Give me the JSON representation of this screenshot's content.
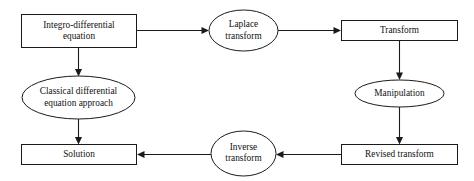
{
  "diagram": {
    "background_color": "#ffffff",
    "stroke_color": "#1a1a1a",
    "text_color": "#111111",
    "nodes": [
      {
        "id": "integro-differential-equation",
        "label": "Integro-differential\nequation",
        "shape": "rectangle",
        "x": 21,
        "y": 14,
        "w": 116,
        "h": 34
      },
      {
        "id": "laplace-transform",
        "label": "Laplace\ntransform",
        "shape": "ellipse",
        "x": 209,
        "y": 10,
        "w": 69,
        "h": 41
      },
      {
        "id": "transform",
        "label": "Transform",
        "shape": "rectangle",
        "x": 341,
        "y": 20,
        "w": 117,
        "h": 21
      },
      {
        "id": "classical-differential-equation-approach",
        "label": "Classical differential\nequation approach",
        "shape": "ellipse",
        "x": 22,
        "y": 76,
        "w": 113,
        "h": 43
      },
      {
        "id": "manipulation",
        "label": "Manipulation",
        "shape": "ellipse",
        "x": 355,
        "y": 80,
        "w": 89,
        "h": 27
      },
      {
        "id": "solution",
        "label": "Solution",
        "shape": "rectangle",
        "x": 21,
        "y": 144,
        "w": 116,
        "h": 21
      },
      {
        "id": "inverse-transform",
        "label": "Inverse\ntransform",
        "shape": "ellipse",
        "x": 211,
        "y": 131,
        "w": 65,
        "h": 44
      },
      {
        "id": "revised-transform",
        "label": "Revised transform",
        "shape": "rectangle",
        "x": 341,
        "y": 144,
        "w": 117,
        "h": 21
      }
    ],
    "edges": [
      {
        "id": "edge-equation-to-laplace",
        "from": "integro-differential-equation",
        "to": "laplace-transform",
        "direction": "right"
      },
      {
        "id": "edge-laplace-to-transform",
        "from": "laplace-transform",
        "to": "transform",
        "direction": "right"
      },
      {
        "id": "edge-equation-to-classical",
        "from": "integro-differential-equation",
        "to": "classical-differential-equation-approach",
        "direction": "down"
      },
      {
        "id": "edge-transform-to-manipulation",
        "from": "transform",
        "to": "manipulation",
        "direction": "down"
      },
      {
        "id": "edge-classical-to-solution",
        "from": "classical-differential-equation-approach",
        "to": "solution",
        "direction": "down"
      },
      {
        "id": "edge-manipulation-to-revised",
        "from": "manipulation",
        "to": "revised-transform",
        "direction": "down"
      },
      {
        "id": "edge-revised-to-inverse",
        "from": "revised-transform",
        "to": "inverse-transform",
        "direction": "left"
      },
      {
        "id": "edge-inverse-to-solution",
        "from": "inverse-transform",
        "to": "solution",
        "direction": "left"
      }
    ]
  }
}
